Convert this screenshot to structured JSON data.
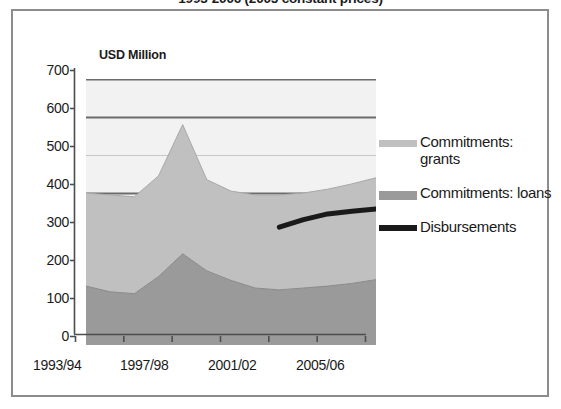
{
  "chart_title": "1993-2006 (2005 constant prices)",
  "y_axis_unit": "USD Million",
  "legend": {
    "items": [
      {
        "label": "Commitments: grants",
        "color": "#c0c0c0",
        "marker": "area-swatch-grants"
      },
      {
        "label": "Commitments: loans",
        "color": "#9a9a9a",
        "marker": "area-swatch-loans"
      },
      {
        "label": "Disbursements",
        "color": "#1a1a1a",
        "marker": "line-swatch-disbursements"
      }
    ]
  },
  "chart_data": {
    "type": "area",
    "title": "1993-2006 (2005 constant prices)",
    "xlabel": "",
    "ylabel": "USD Million",
    "ylim": [
      0,
      700
    ],
    "yticks": [
      0,
      100,
      200,
      300,
      400,
      500,
      600,
      700
    ],
    "ytick_labels": [
      "0",
      "100",
      "200",
      "300",
      "400",
      "500",
      "600",
      "700"
    ],
    "x": [
      "1993/94",
      "1994/95",
      "1995/96",
      "1996/97",
      "1997/98",
      "1998/99",
      "1999/00",
      "2000/01",
      "2001/02",
      "2002/03",
      "2003/04",
      "2004/05",
      "2005/06"
    ],
    "xtick_labels": [
      "1993/94",
      "1997/98",
      "2001/02",
      "2005/06"
    ],
    "xtick_positions": [
      0,
      4,
      8,
      12
    ],
    "grid": true,
    "stacked": true,
    "series": [
      {
        "name": "Commitments: loans",
        "type": "area",
        "color": "#9a9a9a",
        "values": [
          155,
          140,
          135,
          180,
          240,
          195,
          170,
          150,
          145,
          150,
          155,
          162,
          172
        ]
      },
      {
        "name": "Commitments: grants",
        "type": "area",
        "color": "#c0c0c0",
        "values": [
          245,
          255,
          255,
          265,
          340,
          240,
          235,
          245,
          250,
          250,
          255,
          262,
          268
        ]
      },
      {
        "name": "Disbursements",
        "type": "line",
        "color": "#1a1a1a",
        "x_start": "2001/02",
        "values": [
          null,
          null,
          null,
          null,
          null,
          null,
          null,
          null,
          310,
          330,
          345,
          352,
          358
        ]
      }
    ],
    "stacked_totals": [
      400,
      395,
      390,
      445,
      580,
      435,
      405,
      395,
      395,
      400,
      410,
      424,
      440
    ]
  }
}
